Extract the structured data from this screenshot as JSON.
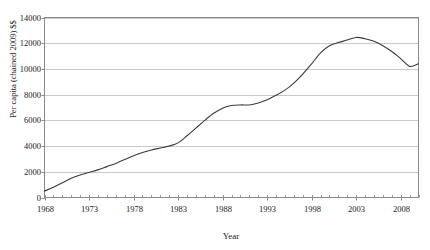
{
  "chart_data": {
    "type": "line",
    "title": "",
    "xlabel": "Year",
    "ylabel": "Per capita (chained 2009) $$",
    "xlim": [
      1968,
      2010
    ],
    "ylim": [
      0,
      14000
    ],
    "grid": true,
    "legend": false,
    "yticks": [
      14000,
      12000,
      10000,
      8000,
      6000,
      4000,
      2000,
      0
    ],
    "ytick_labels": [
      "14000",
      "12000",
      "10000",
      "8000",
      "6000",
      "4000",
      "2000",
      "0"
    ],
    "xticks": [
      1968,
      1973,
      1978,
      1983,
      1988,
      1993,
      1998,
      2003,
      2008
    ],
    "xtick_labels": [
      "1968",
      "1973",
      "1978",
      "1983",
      "1988",
      "1993",
      "1998",
      "2003",
      "2008"
    ],
    "xminor_step": 1,
    "line_color": "#3a3a3a",
    "grid_color": "#c8c8c8",
    "series": [
      {
        "name": "Per capita (chained 2009) $$",
        "x": [
          1968,
          1969,
          1970,
          1971,
          1972,
          1973,
          1974,
          1975,
          1976,
          1977,
          1978,
          1979,
          1980,
          1981,
          1982,
          1983,
          1984,
          1985,
          1986,
          1987,
          1988,
          1989,
          1990,
          1991,
          1992,
          1993,
          1994,
          1995,
          1996,
          1997,
          1998,
          1999,
          2000,
          2001,
          2002,
          2003,
          2004,
          2005,
          2006,
          2007,
          2008,
          2009,
          2010
        ],
        "values": [
          500,
          800,
          1150,
          1500,
          1750,
          1950,
          2150,
          2400,
          2650,
          2950,
          3250,
          3500,
          3700,
          3850,
          4000,
          4250,
          4800,
          5400,
          6000,
          6550,
          6950,
          7150,
          7200,
          7200,
          7350,
          7600,
          7950,
          8350,
          8900,
          9600,
          10400,
          11250,
          11800,
          12050,
          12250,
          12450,
          12350,
          12150,
          11800,
          11350,
          10800,
          10200,
          10400
        ]
      }
    ]
  }
}
